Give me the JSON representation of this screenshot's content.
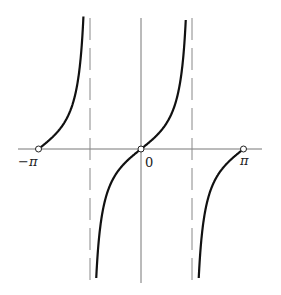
{
  "chart_data": {
    "type": "line",
    "title": "",
    "function": "tan(x)",
    "xlabel": "",
    "ylabel": "",
    "xlim": [
      -3.14159,
      3.14159
    ],
    "ylim": [
      -5,
      5
    ],
    "x_ticks": [
      {
        "value": -3.14159,
        "label": "−π"
      },
      {
        "value": 0,
        "label": "0"
      },
      {
        "value": 3.14159,
        "label": "π"
      }
    ],
    "asymptotes": [
      -1.5708,
      1.5708
    ],
    "open_points": [
      -3.14159,
      0,
      3.14159
    ],
    "grid": false,
    "series": [
      {
        "name": "tan x",
        "x": [
          -3.1416,
          -2.8,
          -2.4,
          -2.0,
          -1.8,
          -1.65
        ],
        "y": [
          0,
          0.36,
          0.92,
          2.19,
          4.29,
          12.6
        ]
      },
      {
        "name": "tan x",
        "x": [
          -1.45,
          -1.2,
          -0.8,
          -0.4,
          0,
          0.4,
          0.8,
          1.2,
          1.45
        ],
        "y": [
          -8.2,
          -2.57,
          -1.03,
          -0.42,
          0,
          0.42,
          1.03,
          2.57,
          8.2
        ]
      },
      {
        "name": "tan x",
        "x": [
          1.65,
          1.8,
          2.0,
          2.4,
          2.8,
          3.1416
        ],
        "y": [
          -12.6,
          -4.29,
          -2.19,
          -0.92,
          -0.36,
          0
        ]
      }
    ]
  },
  "labels": {
    "neg_pi": "−π",
    "zero": "0",
    "pi": "π"
  }
}
